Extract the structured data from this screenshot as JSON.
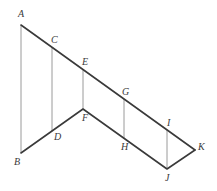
{
  "diagram": {
    "points": {
      "A": {
        "label": "A",
        "x": 21,
        "y": 25,
        "lx": 18,
        "ly": 17
      },
      "B": {
        "label": "B",
        "x": 21,
        "y": 153,
        "lx": 14,
        "ly": 165
      },
      "C": {
        "label": "C",
        "x": 52,
        "y": 47,
        "lx": 51,
        "ly": 43
      },
      "D": {
        "label": "D",
        "x": 52,
        "y": 131,
        "lx": 54,
        "ly": 140
      },
      "E": {
        "label": "E",
        "x": 83,
        "y": 69,
        "lx": 82,
        "ly": 65
      },
      "F": {
        "label": "F",
        "x": 83,
        "y": 109,
        "lx": 82,
        "ly": 121
      },
      "G": {
        "label": "G",
        "x": 124,
        "y": 99,
        "lx": 123,
        "ly": 95
      },
      "H": {
        "label": "H",
        "x": 124,
        "y": 139,
        "lx": 121,
        "ly": 150
      },
      "I": {
        "label": "I",
        "x": 167,
        "y": 130,
        "lx": 167,
        "ly": 126
      },
      "J": {
        "label": "J",
        "x": 167,
        "y": 169,
        "lx": 166,
        "ly": 181
      },
      "K": {
        "label": "K",
        "x": 195,
        "y": 150,
        "lx": 197,
        "ly": 149
      }
    },
    "thick_segments": [
      [
        "A",
        "K"
      ],
      [
        "B",
        "F"
      ],
      [
        "F",
        "J"
      ],
      [
        "J",
        "K"
      ]
    ],
    "thin_segments": [
      [
        "A",
        "B"
      ],
      [
        "C",
        "D"
      ],
      [
        "E",
        "F"
      ],
      [
        "G",
        "H"
      ],
      [
        "I",
        "J"
      ]
    ]
  }
}
